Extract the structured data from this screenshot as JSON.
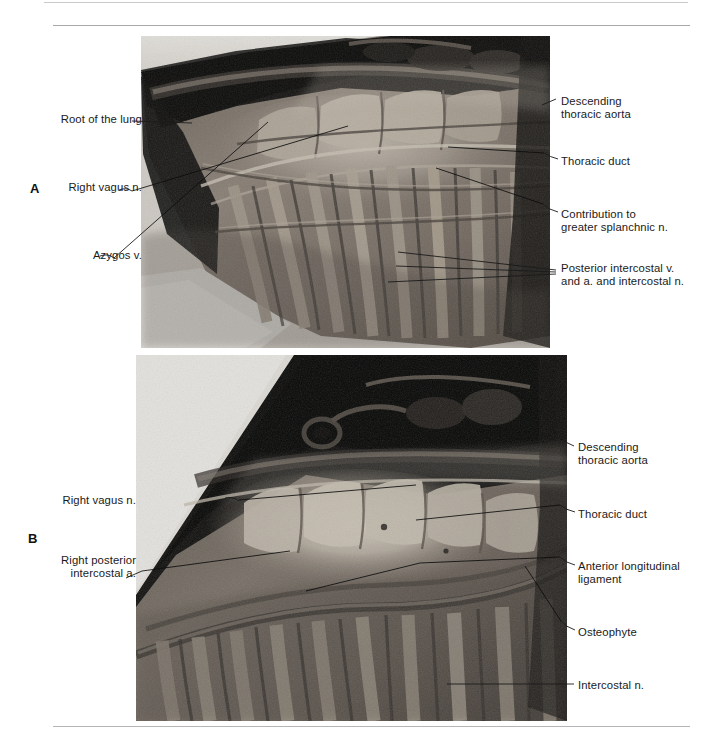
{
  "figure": {
    "type": "anatomical-photograph-plate",
    "panel_count": 2,
    "rules": {
      "color": "#b5b5b5"
    }
  },
  "panels": [
    {
      "letter": "A",
      "labels_left": [
        {
          "name": "root-of-the-lung",
          "text": "Root of the lung"
        },
        {
          "name": "right-vagus-nerve",
          "text": "Right vagus n."
        },
        {
          "name": "azygos-vein",
          "text": "Azygos v."
        }
      ],
      "labels_right": [
        {
          "name": "descending-thoracic-aorta",
          "text": "Descending\nthoracic aorta"
        },
        {
          "name": "thoracic-duct",
          "text": "Thoracic duct"
        },
        {
          "name": "greater-splanchnic-nerve",
          "text": "Contribution to\ngreater splanchnic n."
        },
        {
          "name": "posterior-intercostal-vessels-and-nerve",
          "text": "Posterior intercostal v.\nand a. and intercostal n."
        }
      ]
    },
    {
      "letter": "B",
      "labels_left": [
        {
          "name": "right-vagus-nerve",
          "text": "Right vagus n."
        },
        {
          "name": "right-posterior-intercostal-artery",
          "text": "Right posterior\nintercostal a."
        }
      ],
      "labels_right": [
        {
          "name": "descending-thoracic-aorta",
          "text": "Descending\nthoracic aorta"
        },
        {
          "name": "thoracic-duct",
          "text": "Thoracic duct"
        },
        {
          "name": "anterior-longitudinal-ligament",
          "text": "Anterior longitudinal\nligament"
        },
        {
          "name": "osteophyte",
          "text": "Osteophyte"
        },
        {
          "name": "intercostal-nerve",
          "text": "Intercostal n."
        }
      ]
    }
  ],
  "colors": {
    "text": "#1a1a1a",
    "rule": "#b5b5b5",
    "leader": "#1b1b1b",
    "photo_dark": "#161616",
    "photo_mid": "#7a716a",
    "photo_light": "#c9c2b8",
    "page_background": "#ffffff"
  }
}
